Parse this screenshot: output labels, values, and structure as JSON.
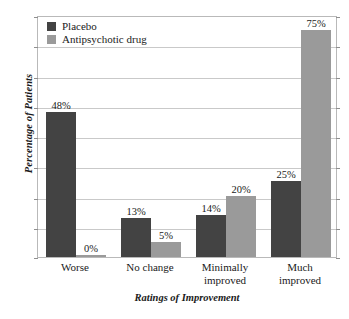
{
  "chart_data": {
    "type": "bar",
    "title": "",
    "xlabel": "Ratings of Improvement",
    "ylabel": "Percentage of Patients",
    "categories": [
      "Worse",
      "No change",
      "Minimally improved",
      "Much improved"
    ],
    "category_lines": [
      [
        "Worse"
      ],
      [
        "No change"
      ],
      [
        "Minimally",
        "improved"
      ],
      [
        "Much",
        "improved"
      ]
    ],
    "series": [
      {
        "name": "Placebo",
        "color": "#434343",
        "values": [
          48,
          13,
          14,
          25
        ],
        "labels": [
          "48%",
          "13%",
          "14%",
          "25%"
        ]
      },
      {
        "name": "Antipsychotic drug",
        "color": "#9a9a9a",
        "values": [
          0,
          5,
          20,
          75
        ],
        "labels": [
          "0%",
          "5%",
          "20%",
          "75%"
        ]
      }
    ],
    "ylim": [
      0,
      80
    ],
    "y_tick_values": [
      0,
      10,
      20,
      30,
      40,
      50,
      60,
      70,
      80
    ],
    "y_tick_labels_shown": false,
    "grid": true,
    "legend_position": "top-left-inside",
    "value_labels_shown": true,
    "units": "percent"
  },
  "legend": {
    "items": [
      {
        "label": "Placebo",
        "color": "#434343"
      },
      {
        "label": "Antipsychotic drug",
        "color": "#9a9a9a"
      }
    ]
  },
  "axes": {
    "y_title": "Percentage of Patients",
    "x_title": "Ratings of Improvement"
  },
  "colors": {
    "placebo": "#434343",
    "drug": "#9a9a9a",
    "grid": "#c9c9c9",
    "frame": "#b9b9b9",
    "text": "#1a1a1a",
    "background": "#ffffff"
  }
}
